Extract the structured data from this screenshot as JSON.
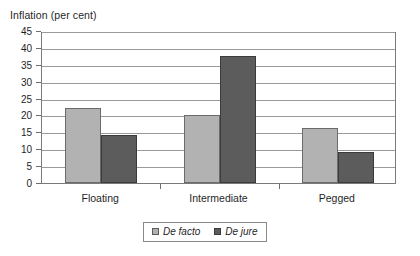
{
  "chart_data": {
    "type": "bar",
    "title": "",
    "ylabel": "Inflation (per cent)",
    "xlabel": "",
    "categories": [
      "Floating",
      "Intermediate",
      "Pegged"
    ],
    "series": [
      {
        "name": "De facto",
        "values": [
          22.2,
          20.0,
          16.2
        ]
      },
      {
        "name": "De jure",
        "values": [
          14.2,
          37.6,
          9.2
        ]
      }
    ],
    "ylim": [
      0,
      45
    ],
    "yticks": [
      0,
      5,
      10,
      15,
      20,
      25,
      30,
      35,
      40,
      45
    ],
    "ytick_labels": [
      "0",
      "5",
      "10",
      "15",
      "20",
      "25",
      "30",
      "35",
      "40",
      "45"
    ],
    "grid": true,
    "legend_position": "bottom-center",
    "colors": {
      "de_facto": "#b2b2b2",
      "de_jure": "#5c5c5c",
      "gridline": "#9a9a9a",
      "frame": "#7a7a7a",
      "text": "#1f1f1f"
    }
  },
  "legend": {
    "entries": [
      {
        "label": "De facto"
      },
      {
        "label": "De jure"
      }
    ]
  }
}
